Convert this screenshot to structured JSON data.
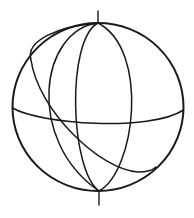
{
  "diagram": {
    "type": "sphere-wireframe",
    "stroke_color": "#1a1a1a",
    "background": "#ffffff",
    "elements": [
      "outer-circle",
      "polar-axis",
      "equator",
      "central-meridian",
      "left-meridian",
      "inclined-great-circle"
    ]
  }
}
